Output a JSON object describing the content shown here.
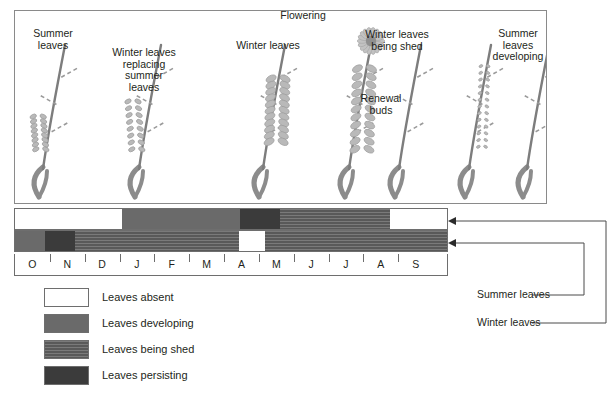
{
  "figure": {
    "illustration_captions": [
      {
        "text": "Summer\nleaves",
        "x": 18,
        "y": 28,
        "w": 70
      },
      {
        "text": "Winter leaves\nreplacing\nsummer\nleaves",
        "x": 104,
        "y": 47,
        "w": 80
      },
      {
        "text": "Winter leaves",
        "x": 228,
        "y": 40,
        "w": 80
      },
      {
        "text": "Flowering",
        "x": 272,
        "y": 10,
        "w": 62
      },
      {
        "text": "Winter leaves\nbeing shed",
        "x": 356,
        "y": 29,
        "w": 82
      },
      {
        "text": "Renewal\nbuds",
        "x": 355,
        "y": 93,
        "w": 52
      },
      {
        "text": "Summer\nleaves\ndeveloping",
        "x": 487,
        "y": 28,
        "w": 62
      }
    ],
    "plant_stages": [
      {
        "name": "summer-leaves-stage",
        "x": 24,
        "flower": false,
        "leaf_span": [
          0.52,
          0.78
        ],
        "leaf_size": "small"
      },
      {
        "name": "winter-replacing-summer-stage",
        "x": 120,
        "flower": false,
        "leaf_span": [
          0.4,
          0.78
        ],
        "leaf_size": "small"
      },
      {
        "name": "winter-leaves-stage",
        "x": 244,
        "flower": false,
        "leaf_span": [
          0.22,
          0.72
        ],
        "leaf_size": "large"
      },
      {
        "name": "flowering-stage",
        "x": 330,
        "flower": true,
        "leaf_span": [
          0.14,
          0.78
        ],
        "leaf_size": "large"
      },
      {
        "name": "winter-leaves-shed-stage",
        "x": 380,
        "flower": false,
        "leaf_span": [
          0.62,
          0.8
        ],
        "leaf_size": "none"
      },
      {
        "name": "summer-leaves-developing-stage",
        "x": 450,
        "flower": false,
        "leaf_span": [
          0.12,
          0.76
        ],
        "leaf_size": "tiny"
      },
      {
        "name": "bare-stage",
        "x": 508,
        "flower": false,
        "leaf_span": [
          0.6,
          0.78
        ],
        "leaf_size": "none"
      }
    ]
  },
  "colors": {
    "absent": "#ffffff",
    "developing": "#6a6a6a",
    "being_shed": "#595959",
    "persisting": "#3b3b3b",
    "border": "#6e6e6e",
    "text": "#231f20"
  },
  "chart_data": {
    "type": "bar",
    "title": "",
    "xlabel": "",
    "ylabel": "",
    "categories": [
      "O",
      "N",
      "D",
      "J",
      "F",
      "M",
      "A",
      "M",
      "J",
      "J",
      "A",
      "S"
    ],
    "series": [
      {
        "name": "Summer leaves",
        "segments": [
          {
            "state": "Leaves absent",
            "start_month": "O",
            "end_month": "D",
            "start": 0.0,
            "end": 3.43
          },
          {
            "state": "Leaves developing",
            "start_month": "J",
            "end_month": "M",
            "start": 3.43,
            "end": 7.2
          },
          {
            "state": "Leaves persisting",
            "start_month": "A",
            "end_month": "A",
            "start": 7.2,
            "end": 8.47
          },
          {
            "state": "Leaves being shed",
            "start_month": "M",
            "end_month": "A",
            "start": 8.47,
            "end": 12.0
          },
          {
            "state": "Leaves absent",
            "start_month": "A",
            "end_month": "S",
            "start": 12.0,
            "end": 13.83
          }
        ]
      },
      {
        "name": "Winter leaves",
        "segments": [
          {
            "state": "Leaves developing",
            "start_month": "O",
            "end_month": "O",
            "start": 0.0,
            "end": 0.97
          },
          {
            "state": "Leaves persisting",
            "start_month": "N",
            "end_month": "N",
            "start": 0.97,
            "end": 1.91
          },
          {
            "state": "Leaves being shed",
            "start_month": "D",
            "end_month": "M",
            "start": 1.91,
            "end": 7.17
          },
          {
            "state": "Leaves absent",
            "start_month": "A",
            "end_month": "A",
            "start": 7.17,
            "end": 8.0
          },
          {
            "state": "Leaves being shed",
            "start_month": "M",
            "end_month": "S",
            "start": 8.0,
            "end": 13.83
          }
        ]
      }
    ],
    "legend_entries": [
      {
        "label": "Leaves absent",
        "color_key": "absent"
      },
      {
        "label": "Leaves developing",
        "color_key": "developing"
      },
      {
        "label": "Leaves being shed",
        "color_key": "being_shed"
      },
      {
        "label": "Leaves persisting",
        "color_key": "persisting"
      }
    ],
    "series_callouts": [
      {
        "label": "Summer leaves",
        "target": "top-bar"
      },
      {
        "label": "Winter leaves",
        "target": "bottom-bar"
      }
    ],
    "grid": false,
    "legend_position": "bottom-left"
  }
}
